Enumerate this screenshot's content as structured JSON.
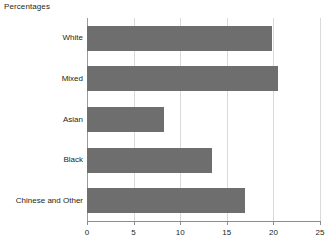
{
  "chart_data": {
    "type": "bar",
    "orientation": "horizontal",
    "title": "Percentages",
    "xlabel": "",
    "ylabel": "",
    "categories": [
      "White",
      "Mixed",
      "Asian",
      "Black",
      "Chinese and Other"
    ],
    "values": [
      19.8,
      20.5,
      8.3,
      13.4,
      17.0
    ],
    "xlim": [
      0,
      25
    ],
    "xticks": [
      0,
      5,
      10,
      15,
      20,
      25
    ],
    "xtick_labels": [
      "0",
      "5",
      "10",
      "15",
      "20",
      "25"
    ],
    "grid": "vertical",
    "legend": "none",
    "bar_color": "#6e6e6e",
    "gridline_color": "#d9d9d9",
    "axis_color": "#8c8c8c",
    "text_color": "#231f20"
  }
}
